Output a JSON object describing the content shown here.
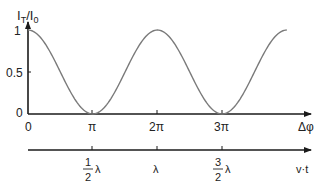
{
  "chart_data": {
    "type": "line",
    "title": "",
    "ylabel": "I_T / I_0",
    "xlabel": "Δφ",
    "secondary_xlabel": "v·t",
    "function": "I_T/I_0 = cos^2(Δφ/2)",
    "ylim": [
      0,
      1
    ],
    "xlim_rad": [
      0,
      12.566
    ],
    "y_ticks": [
      "0",
      "0.5",
      "1"
    ],
    "x_ticks": [
      "0",
      "π",
      "2π",
      "3π"
    ],
    "secondary_x_ticks": [
      "1/2 λ",
      "λ",
      "3/2 λ"
    ],
    "grid": false,
    "series": [
      {
        "name": "transmitted intensity",
        "x": [
          0,
          0.785,
          1.571,
          2.356,
          3.142,
          3.927,
          4.712,
          5.498,
          6.283,
          7.069,
          7.854,
          8.639,
          9.425,
          10.21,
          10.996,
          11.781,
          12.566
        ],
        "values": [
          1.0,
          0.854,
          0.5,
          0.146,
          0.0,
          0.146,
          0.5,
          0.854,
          1.0,
          0.854,
          0.5,
          0.146,
          0.0,
          0.146,
          0.5,
          0.854,
          1.0
        ]
      }
    ],
    "line_color": "#7a7a7a",
    "axis_color": "#1a1a1a"
  },
  "labels": {
    "y_axis_main": "I",
    "y_axis_sub1": "T",
    "y_axis_sep": "/",
    "y_axis_main2": "I",
    "y_axis_sub2": "0",
    "y_tick_1": "1",
    "y_tick_05": "0.5",
    "y_tick_0": "0",
    "x_tick_0": "0",
    "x_tick_pi": "π",
    "x_tick_2pi": "2π",
    "x_tick_3pi": "3π",
    "x_axis": "Δφ",
    "sec_tick1_num": "1",
    "sec_tick1_den": "2",
    "sec_tick1_sym": "λ",
    "sec_tick2": "λ",
    "sec_tick3_num": "3",
    "sec_tick3_den": "2",
    "sec_tick3_sym": "λ",
    "sec_axis": "v·t"
  }
}
